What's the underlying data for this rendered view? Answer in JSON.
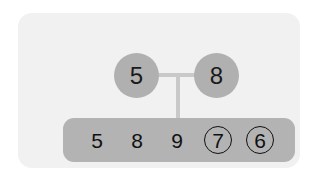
{
  "card": {
    "background_color": "#f1f1f1"
  },
  "colors": {
    "canvas": "#ffffff",
    "card": "#f1f1f1",
    "node_fill": "#b0b0b0",
    "bar_fill": "#b3b3b3",
    "connector": "#c9c9c9",
    "text": "#111111"
  },
  "diagram": {
    "parents": [
      {
        "label": "5",
        "position": "left"
      },
      {
        "label": "8",
        "position": "right"
      }
    ],
    "sequence": {
      "cells": [
        {
          "value": "5",
          "circled": false
        },
        {
          "value": "8",
          "circled": false
        },
        {
          "value": "9",
          "circled": false
        },
        {
          "value": "7",
          "circled": true
        },
        {
          "value": "6",
          "circled": true
        }
      ]
    }
  }
}
